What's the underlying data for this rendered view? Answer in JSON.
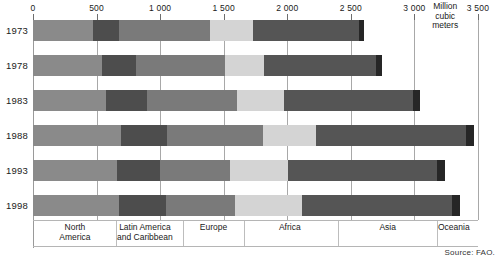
{
  "chart_data": {
    "type": "bar",
    "orientation": "horizontal",
    "stacked": true,
    "title": "",
    "subtitle": "",
    "xlabel": "Million cubic meters",
    "ylabel": "",
    "xlim": [
      0,
      3500
    ],
    "grid": true,
    "legend_position": "bottom-inline",
    "unit_label": "Million\ncubic\nmeters",
    "source": "Source: FAO.",
    "xticks": [
      0,
      500,
      1000,
      1500,
      2000,
      2500,
      3000,
      3500
    ],
    "xtick_labels": [
      "0",
      "500",
      "1 000",
      "1 500",
      "2 000",
      "2 500",
      "3 000",
      "3 500"
    ],
    "categories": [
      "1973",
      "1978",
      "1983",
      "1988",
      "1993",
      "1998"
    ],
    "series": [
      {
        "name": "North America",
        "color": "#8a8a8a",
        "values": [
          470,
          545,
          575,
          690,
          660,
          675
        ]
      },
      {
        "name": "Latin America and Caribbean",
        "color": "#4d4d4d",
        "values": [
          205,
          265,
          320,
          365,
          340,
          370
        ]
      },
      {
        "name": "Europe",
        "color": "#7a7a7a",
        "values": [
          715,
          700,
          710,
          755,
          550,
          545
        ]
      },
      {
        "name": "Africa",
        "color": "#d4d4d4",
        "values": [
          340,
          305,
          370,
          415,
          455,
          525
        ]
      },
      {
        "name": "Asia",
        "color": "#555555",
        "values": [
          835,
          885,
          1010,
          1180,
          1175,
          1180
        ]
      },
      {
        "name": "Oceania",
        "color": "#262626",
        "values": [
          40,
          45,
          55,
          60,
          60,
          65
        ]
      }
    ],
    "category_labels": [
      {
        "text": "North\nAmerica",
        "center_value": 330
      },
      {
        "text": "Latin America\nand Caribbean",
        "center_value": 880
      },
      {
        "text": "Europe",
        "center_value": 1420
      },
      {
        "text": "Africa",
        "center_value": 2020
      },
      {
        "text": "Asia",
        "center_value": 2790
      },
      {
        "text": "Oceania",
        "center_value": 3310
      }
    ],
    "category_dividers": [
      650,
      1180,
      1660,
      2400,
      3180
    ]
  }
}
